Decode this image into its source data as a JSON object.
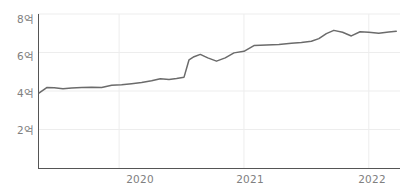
{
  "chart_data": {
    "type": "line",
    "title": "",
    "subtitle": "",
    "xlabel": "",
    "ylabel": "",
    "grid": true,
    "legend": false,
    "legend_position": "none",
    "line_color": "#6b6b6b",
    "axis_color": "#555555",
    "grid_color": "#ededed",
    "tick_label_color": "#808080",
    "unit": "억",
    "xlim": [
      2019.35,
      2022.25
    ],
    "ylim": [
      0,
      8
    ],
    "yticks": [
      2,
      4,
      6,
      8
    ],
    "ytick_labels": [
      "2억",
      "4억",
      "6억",
      "8억"
    ],
    "xticks": [
      2020,
      2021,
      2022
    ],
    "xtick_labels": [
      "2020",
      "2021",
      "2022"
    ],
    "series": [
      {
        "name": "series-1",
        "x": [
          2019.36,
          2019.42,
          2019.48,
          2019.55,
          2019.62,
          2019.7,
          2019.78,
          2019.86,
          2019.94,
          2020.02,
          2020.1,
          2020.18,
          2020.26,
          2020.33,
          2020.4,
          2020.46,
          2020.52,
          2020.56,
          2020.6,
          2020.65,
          2020.71,
          2020.78,
          2020.85,
          2020.92,
          2021.0,
          2021.08,
          2021.18,
          2021.28,
          2021.38,
          2021.46,
          2021.54,
          2021.6,
          2021.66,
          2021.72,
          2021.79,
          2021.86,
          2021.93,
          2022.0,
          2022.08,
          2022.16,
          2022.22
        ],
        "values": [
          3.9,
          4.18,
          4.17,
          4.12,
          4.16,
          4.18,
          4.19,
          4.18,
          4.3,
          4.33,
          4.38,
          4.44,
          4.53,
          4.64,
          4.6,
          4.65,
          4.72,
          5.62,
          5.78,
          5.9,
          5.72,
          5.55,
          5.72,
          5.98,
          6.06,
          6.36,
          6.39,
          6.42,
          6.48,
          6.52,
          6.58,
          6.72,
          6.98,
          7.15,
          7.05,
          6.86,
          7.08,
          7.05,
          7.0,
          7.06,
          7.1
        ]
      }
    ]
  }
}
